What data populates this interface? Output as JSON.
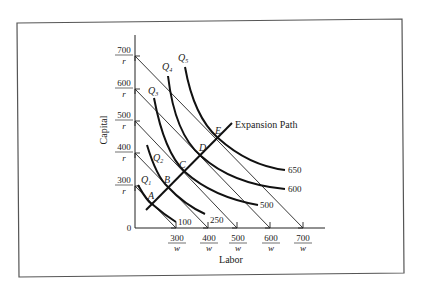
{
  "figure": {
    "y_axis_label": "Capital",
    "x_axis_label": "Labor",
    "origin_label": "0",
    "expansion_path_label": "Expansion Path",
    "y_ticks": [
      {
        "num": "700",
        "den": "r"
      },
      {
        "num": "600",
        "den": "r"
      },
      {
        "num": "500",
        "den": "r"
      },
      {
        "num": "400",
        "den": "r"
      },
      {
        "num": "300",
        "den": "r"
      }
    ],
    "x_ticks": [
      {
        "num": "300",
        "den": "w"
      },
      {
        "num": "400",
        "den": "w"
      },
      {
        "num": "500",
        "den": "w"
      },
      {
        "num": "600",
        "den": "w"
      },
      {
        "num": "700",
        "den": "w"
      }
    ],
    "isoquants": [
      {
        "name": "Q",
        "sub": "1",
        "output": "100"
      },
      {
        "name": "Q",
        "sub": "2",
        "output": "250"
      },
      {
        "name": "Q",
        "sub": "3",
        "output": "500"
      },
      {
        "name": "Q",
        "sub": "4",
        "output": "600"
      },
      {
        "name": "Q",
        "sub": "5",
        "output": "650"
      }
    ],
    "points": [
      "A",
      "B",
      "C",
      "D",
      "E"
    ]
  }
}
